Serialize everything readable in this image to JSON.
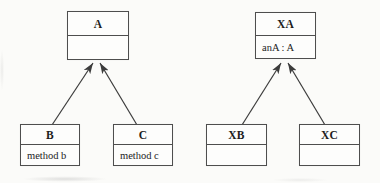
{
  "diagram": {
    "type": "uml-class-diagram",
    "background_color": "#fbfbf9",
    "box_fill_color": "#fdfdfc",
    "box_border_color": "#4e4e4e",
    "line_color": "#3c3c3c",
    "text_color": "#1c1c1c",
    "classes": [
      {
        "id": "a",
        "name": "A",
        "attribute": "",
        "x": 67,
        "y": 11,
        "w": 62,
        "titleH": 23,
        "bodyH": 23
      },
      {
        "id": "xa",
        "name": "XA",
        "attribute": "anA : A",
        "x": 255,
        "y": 12,
        "w": 61,
        "titleH": 22,
        "bodyH": 22
      },
      {
        "id": "b",
        "name": "B",
        "attribute": "method b",
        "x": 20,
        "y": 124,
        "w": 60,
        "titleH": 19,
        "bodyH": 20
      },
      {
        "id": "c",
        "name": "C",
        "attribute": "method c",
        "x": 113,
        "y": 124,
        "w": 60,
        "titleH": 19,
        "bodyH": 20
      },
      {
        "id": "xb",
        "name": "XB",
        "attribute": "",
        "x": 206,
        "y": 124,
        "w": 61,
        "titleH": 19,
        "bodyH": 20
      },
      {
        "id": "xc",
        "name": "XC",
        "attribute": "",
        "x": 299,
        "y": 124,
        "w": 61,
        "titleH": 19,
        "bodyH": 20
      }
    ],
    "arrows": [
      {
        "from_class": "b",
        "to_class": "a",
        "x1": 52,
        "y1": 125,
        "x2": 93,
        "y2": 63
      },
      {
        "from_class": "c",
        "to_class": "a",
        "x1": 137,
        "y1": 125,
        "x2": 100,
        "y2": 63
      },
      {
        "from_class": "xb",
        "to_class": "xa",
        "x1": 242,
        "y1": 125,
        "x2": 281,
        "y2": 63
      },
      {
        "from_class": "xc",
        "to_class": "xa",
        "x1": 325,
        "y1": 125,
        "x2": 288,
        "y2": 63
      }
    ]
  }
}
